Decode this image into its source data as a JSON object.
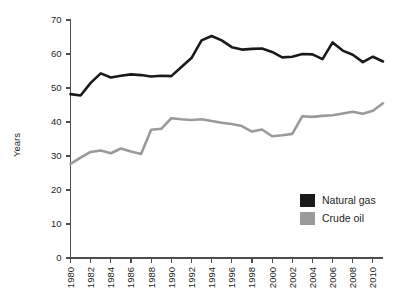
{
  "chart_data": {
    "type": "line",
    "title": "",
    "xlabel": "",
    "ylabel": "Years",
    "xlim": [
      1980,
      2011
    ],
    "ylim": [
      0,
      70
    ],
    "grid": false,
    "legend_position": "bottom-right",
    "yticks": [
      0,
      10,
      20,
      30,
      40,
      50,
      60,
      70
    ],
    "ytick_labels": [
      "0",
      "10",
      "20",
      "30",
      "40",
      "50",
      "60",
      "70"
    ],
    "xticks": [
      1980,
      1982,
      1984,
      1986,
      1988,
      1990,
      1992,
      1994,
      1996,
      1998,
      2000,
      2002,
      2004,
      2006,
      2008,
      2010
    ],
    "xtick_labels": [
      "1980",
      "1982",
      "1984",
      "1986",
      "1988",
      "1990",
      "1992",
      "1994",
      "1996",
      "1998",
      "2000",
      "2002",
      "2004",
      "2006",
      "2008",
      "2010"
    ],
    "x": [
      1980,
      1981,
      1982,
      1983,
      1984,
      1985,
      1986,
      1987,
      1988,
      1989,
      1990,
      1991,
      1992,
      1993,
      1994,
      1995,
      1996,
      1997,
      1998,
      1999,
      2000,
      2001,
      2002,
      2003,
      2004,
      2005,
      2006,
      2007,
      2008,
      2009,
      2010,
      2011
    ],
    "series": [
      {
        "name": "Natural gas",
        "color": "#1a1a1a",
        "values": [
          48.2,
          47.8,
          51.5,
          54.3,
          53.1,
          53.6,
          54.0,
          53.8,
          53.4,
          53.6,
          53.5,
          56.2,
          58.8,
          64.0,
          65.3,
          64.0,
          62.0,
          61.3,
          61.5,
          61.6,
          60.6,
          59.0,
          59.2,
          60.0,
          59.9,
          58.5,
          63.4,
          61.0,
          59.8,
          57.6,
          59.2,
          57.8
        ]
      },
      {
        "name": "Crude oil",
        "color": "#9a9a9a",
        "values": [
          27.7,
          29.5,
          31.2,
          31.6,
          30.8,
          32.2,
          31.3,
          30.6,
          37.7,
          38.0,
          41.1,
          40.8,
          40.6,
          40.8,
          40.3,
          39.8,
          39.4,
          38.8,
          37.2,
          37.8,
          35.8,
          36.1,
          36.5,
          41.7,
          41.5,
          41.8,
          42.0,
          42.5,
          43.0,
          42.4,
          43.3,
          45.5
        ]
      }
    ]
  },
  "legend": {
    "items": [
      {
        "label": "Natural gas",
        "color": "#1a1a1a"
      },
      {
        "label": "Crude oil",
        "color": "#9a9a9a"
      }
    ]
  }
}
